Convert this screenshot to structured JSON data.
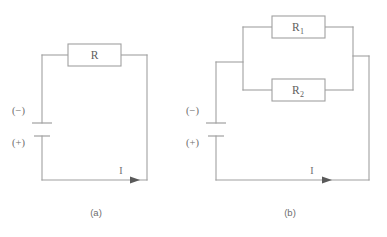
{
  "figure": {
    "type": "circuit-diagram",
    "background_color": "#ffffff",
    "line_color": "#a0a0a0",
    "text_color": "#6e6e6e",
    "arrow_color": "#5a5a5a"
  },
  "panels": [
    {
      "id": "a",
      "caption": "(a)",
      "description": "Single resistor in series with a battery",
      "battery": {
        "negative_label": "(−)",
        "positive_label": "(+)"
      },
      "current": {
        "label": "I",
        "direction": "right"
      },
      "components": [
        {
          "name": "resistor",
          "label": "R",
          "subscript": ""
        }
      ]
    },
    {
      "id": "b",
      "caption": "(b)",
      "description": "Two resistors in parallel with a battery",
      "battery": {
        "negative_label": "(−)",
        "positive_label": "(+)"
      },
      "current": {
        "label": "I",
        "direction": "right"
      },
      "components": [
        {
          "name": "resistor-top",
          "label": "R",
          "subscript": "1"
        },
        {
          "name": "resistor-bottom",
          "label": "R",
          "subscript": "2"
        }
      ]
    }
  ]
}
